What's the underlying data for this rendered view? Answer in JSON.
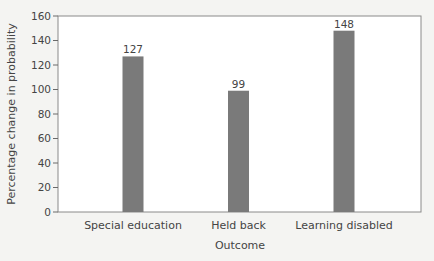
{
  "chart_data": {
    "type": "bar",
    "title": "",
    "xlabel": "Outcome",
    "ylabel": "Percentage change in probability",
    "categories": [
      "Special education",
      "Held back",
      "Learning disabled"
    ],
    "values": [
      127,
      99,
      148
    ],
    "data_labels": [
      "127",
      "99",
      "148"
    ],
    "ylim": [
      0,
      160
    ],
    "yticks": [
      0,
      20,
      40,
      60,
      80,
      100,
      120,
      140,
      160
    ],
    "grid": false,
    "legend": null,
    "bar_color": "#7a7a7a"
  },
  "caption": {
    "text": ""
  }
}
